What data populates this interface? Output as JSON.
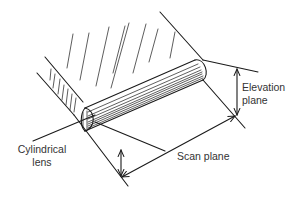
{
  "diagram": {
    "type": "ultrasound transducer beam planes",
    "labels": {
      "elevation_line1": "Elevation",
      "elevation_line2": "plane",
      "scan": "Scan plane",
      "lens_line1": "Cylindrical",
      "lens_line2": "lens"
    },
    "colors": {
      "stroke": "#1a1a1a",
      "text": "#333333",
      "background": "#ffffff"
    }
  }
}
